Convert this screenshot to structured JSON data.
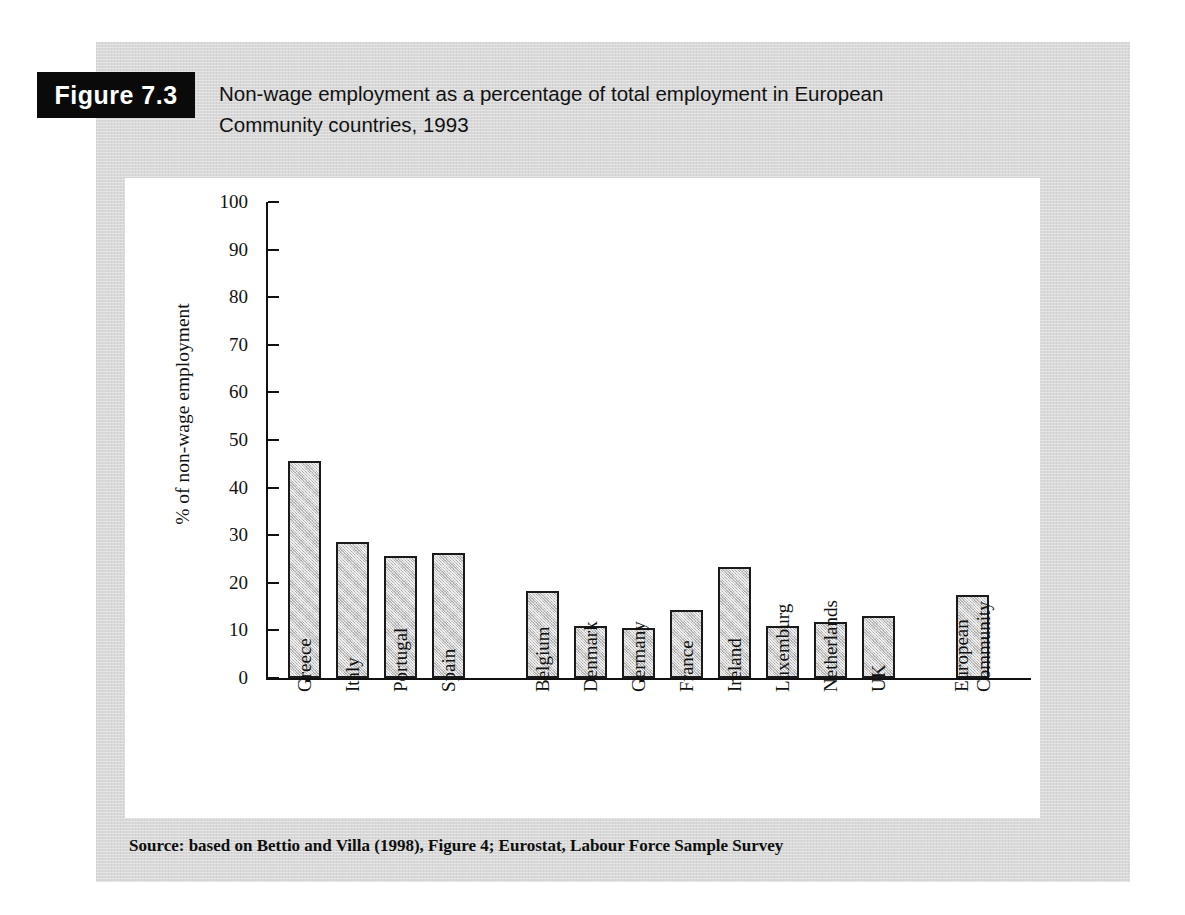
{
  "figure": {
    "badge_label": "Figure 7.3",
    "caption_line1": "Non-wage employment as a percentage of total employment in European",
    "caption_line2": "Community countries, 1993",
    "source": "Source: based on Bettio and Villa (1998), Figure 4; Eurostat, Labour Force Sample Survey"
  },
  "colors": {
    "panel_background": "#d9d9d9",
    "plot_background": "#ffffff",
    "badge_background": "#0a0a0a",
    "badge_text": "#ffffff",
    "bar_fill": "#c9c9c9",
    "bar_border": "#1a1a1a",
    "axis": "#111111",
    "text": "#111111"
  },
  "chart_data": {
    "type": "bar",
    "title": "Non-wage employment as a percentage of total employment in European Community countries, 1993",
    "xlabel": "",
    "ylabel": "% of non-wage employment",
    "ylim": [
      0,
      100
    ],
    "yticks": [
      0,
      10,
      20,
      30,
      40,
      50,
      60,
      70,
      80,
      90,
      100
    ],
    "ytick_labels": [
      "0",
      "10",
      "20",
      "30",
      "40",
      "50",
      "60",
      "70",
      "80",
      "90",
      "100"
    ],
    "grid": false,
    "legend": "none",
    "categories": [
      "Greece",
      "Italy",
      "Portugal",
      "Spain",
      "Belgium",
      "Denmark",
      "Germany",
      "France",
      "Ireland",
      "Luxemburg",
      "Netherlands",
      "UK",
      "European Community"
    ],
    "category_lines": [
      [
        "Greece"
      ],
      [
        "Italy"
      ],
      [
        "Portugal"
      ],
      [
        "Spain"
      ],
      [
        "Belgium"
      ],
      [
        "Denmark"
      ],
      [
        "Germany"
      ],
      [
        "France"
      ],
      [
        "Ireland"
      ],
      [
        "Luxemburg"
      ],
      [
        "Netherlands"
      ],
      [
        "UK"
      ],
      [
        "European",
        "Community"
      ]
    ],
    "values": [
      45.6,
      28.5,
      25.7,
      26.2,
      18.2,
      10.9,
      10.6,
      14.3,
      23.3,
      11.0,
      11.8,
      13.1,
      17.4
    ],
    "groups": [
      {
        "name": "Southern Europe",
        "members": [
          "Greece",
          "Italy",
          "Portugal",
          "Spain"
        ]
      },
      {
        "name": "Northern Europe",
        "members": [
          "Belgium",
          "Denmark",
          "Germany",
          "France",
          "Ireland",
          "Luxemburg",
          "Netherlands",
          "UK"
        ]
      },
      {
        "name": "Aggregate",
        "members": [
          "European Community"
        ]
      }
    ]
  }
}
